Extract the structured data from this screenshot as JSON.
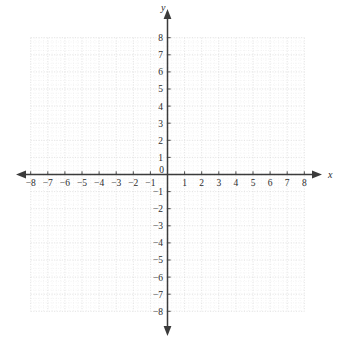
{
  "figure": {
    "type": "coordinate-plane",
    "title": "",
    "background_color": "#ffffff",
    "axis_color": "#3b3b3b",
    "major_grid_color": "#d9d9d9",
    "minor_grid_color": "#e9e9e9"
  },
  "axes": {
    "x_axis_label": "x",
    "y_axis_label": "y",
    "origin_label": "0",
    "x_tick_labels_negative": [
      "−8",
      "−7",
      "−6",
      "−5",
      "−4",
      "−3",
      "−2",
      "−1"
    ],
    "x_tick_labels_positive": [
      "1",
      "2",
      "3",
      "4",
      "5",
      "6",
      "7",
      "8"
    ],
    "y_tick_labels_positive": [
      "1",
      "2",
      "3",
      "4",
      "5",
      "6",
      "7",
      "8"
    ],
    "y_tick_labels_negative": [
      "−1",
      "−2",
      "−3",
      "−4",
      "−5",
      "−6",
      "−7",
      "−8"
    ]
  },
  "chart_data": {
    "type": "scatter",
    "title": "",
    "xlabel": "x",
    "ylabel": "y",
    "xlim": [
      -8,
      8
    ],
    "ylim": [
      -8,
      8
    ],
    "x_ticks": [
      -8,
      -7,
      -6,
      -5,
      -4,
      -3,
      -2,
      -1,
      0,
      1,
      2,
      3,
      4,
      5,
      6,
      7,
      8
    ],
    "y_ticks": [
      -8,
      -7,
      -6,
      -5,
      -4,
      -3,
      -2,
      -1,
      0,
      1,
      2,
      3,
      4,
      5,
      6,
      7,
      8
    ],
    "x_tick_labels": [
      "−8",
      "−7",
      "−6",
      "−5",
      "−4",
      "−3",
      "−2",
      "−1",
      "0",
      "1",
      "2",
      "3",
      "4",
      "5",
      "6",
      "7",
      "8"
    ],
    "y_tick_labels": [
      "−8",
      "−7",
      "−6",
      "−5",
      "−4",
      "−3",
      "−2",
      "−1",
      "0",
      "1",
      "2",
      "3",
      "4",
      "5",
      "6",
      "7",
      "8"
    ],
    "grid": true,
    "grid_minor_subdivisions": 4,
    "legend": null,
    "series": [],
    "values": [],
    "annotations": []
  }
}
